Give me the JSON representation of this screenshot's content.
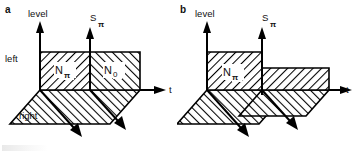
{
  "figure": {
    "background_color": "#ffffff",
    "ink_color": "#000000",
    "panels": [
      {
        "id": "a",
        "letter": "a",
        "axes": {
          "vertical_label": "level",
          "middle_label": "S",
          "middle_sub": "π",
          "horizontal_label": "t"
        },
        "side_labels": {
          "upper": "left",
          "lower": "right"
        },
        "regions": [
          {
            "name": "N",
            "sub": "π",
            "hatch": "backslash"
          },
          {
            "name": "N",
            "sub": "0",
            "hatch": "slash"
          }
        ]
      },
      {
        "id": "b",
        "letter": "b",
        "axes": {
          "vertical_label": "level",
          "middle_label": "S",
          "middle_sub": "π",
          "horizontal_label": "t"
        },
        "side_labels": {
          "upper": "",
          "lower": ""
        },
        "regions": [
          {
            "name": "N",
            "sub": "π",
            "hatch": "backslash"
          }
        ]
      }
    ]
  }
}
